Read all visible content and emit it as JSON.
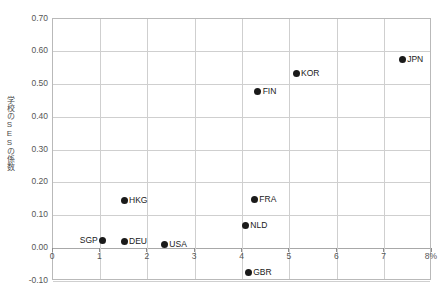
{
  "chart_data": {
    "type": "scatter",
    "title": "",
    "xlabel": "",
    "ylabel": "学校のSESの係数",
    "xlim": [
      0,
      8
    ],
    "ylim": [
      -0.1,
      0.7
    ],
    "x_unit_suffix": "%",
    "grid": true,
    "legend": "none",
    "xticks": [
      "0",
      "1",
      "2",
      "3",
      "4",
      "5",
      "6",
      "7",
      "8%"
    ],
    "xtick_values": [
      0,
      1,
      2,
      3,
      4,
      5,
      6,
      7,
      8
    ],
    "yticks": [
      "-0.10",
      "0.00",
      "0.10",
      "0.20",
      "0.30",
      "0.40",
      "0.50",
      "0.60",
      "0.70"
    ],
    "ytick_values": [
      -0.1,
      0.0,
      0.1,
      0.2,
      0.3,
      0.4,
      0.5,
      0.6,
      0.7
    ],
    "points": [
      {
        "label": "SGP",
        "x": 1.05,
        "y": 0.025,
        "label_side": "left"
      },
      {
        "label": "DEU",
        "x": 1.5,
        "y": 0.02,
        "label_side": "right"
      },
      {
        "label": "HKG",
        "x": 1.5,
        "y": 0.145,
        "label_side": "right"
      },
      {
        "label": "USA",
        "x": 2.35,
        "y": 0.01,
        "label_side": "right"
      },
      {
        "label": "NLD",
        "x": 4.06,
        "y": 0.07,
        "label_side": "right"
      },
      {
        "label": "GBR",
        "x": 4.12,
        "y": -0.075,
        "label_side": "right"
      },
      {
        "label": "FRA",
        "x": 4.25,
        "y": 0.15,
        "label_side": "right"
      },
      {
        "label": "FIN",
        "x": 4.32,
        "y": 0.48,
        "label_side": "right"
      },
      {
        "label": "KOR",
        "x": 5.13,
        "y": 0.535,
        "label_side": "right"
      },
      {
        "label": "JPN",
        "x": 7.37,
        "y": 0.575,
        "label_side": "right"
      }
    ],
    "colors": {
      "marker": "#1a1a1a",
      "grid": "#cfcfcf",
      "axis": "#b9b9b9",
      "text": "#565656",
      "background": "#ffffff"
    }
  },
  "caption": {
    "text": ""
  }
}
